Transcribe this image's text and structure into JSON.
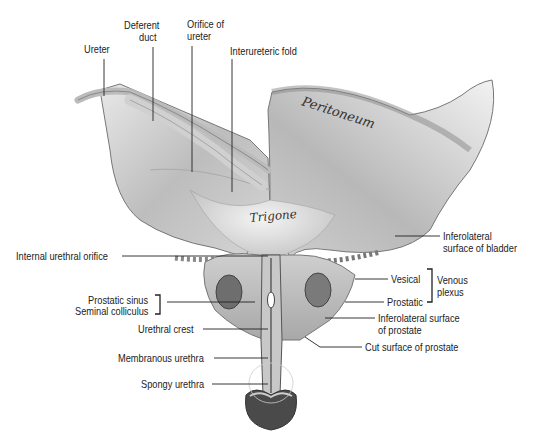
{
  "figure": {
    "inline_labels": {
      "peritoneum": "Peritoneum",
      "trigone": "Trigone"
    },
    "labels": {
      "ureter": "Ureter",
      "deferent_duct_1": "Deferent",
      "deferent_duct_2": "duct",
      "orifice_of_ureter_1": "Orifice of",
      "orifice_of_ureter_2": "ureter",
      "interureteric_fold": "Interureteric fold",
      "internal_urethral_orifice": "Internal urethral orifice",
      "prostatic_sinus": "Prostatic sinus",
      "seminal_colliculus": "Seminal colliculus",
      "urethral_crest": "Urethral crest",
      "membranous_urethra": "Membranous urethra",
      "spongy_urethra": "Spongy urethra",
      "inferolateral_bladder_1": "Inferolateral",
      "inferolateral_bladder_2": "surface of bladder",
      "vesical": "Vesical",
      "prostatic": "Prostatic",
      "venous_1": "Venous",
      "venous_2": "plexus",
      "inferolateral_prostate_1": "Inferolateral surface",
      "inferolateral_prostate_2": "of prostate",
      "cut_surface_prostate": "Cut surface of prostate"
    }
  }
}
